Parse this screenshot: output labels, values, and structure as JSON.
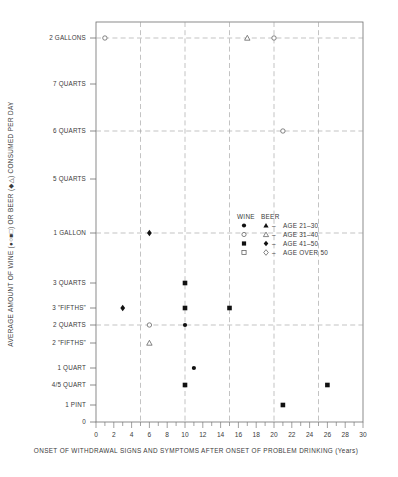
{
  "chart_data": {
    "type": "scatter",
    "title": "",
    "xlabel": "ONSET OF WITHDRAWAL SIGNS AND SYMPTOMS AFTER ONSET OF PROBLEM DRINKING (Years)",
    "ylabel": "AVERAGE AMOUNT OF WINE (●○■□) OR BEER (▲△) CONSUMED PER DAY",
    "xlim": [
      0,
      30
    ],
    "ylim": [
      0,
      12
    ],
    "grid": true,
    "legend_position": "inside-center-right",
    "x_ticks": [
      0,
      2,
      4,
      6,
      8,
      10,
      12,
      14,
      16,
      18,
      20,
      22,
      24,
      26,
      28,
      30
    ],
    "x_tick_labels": [
      "0",
      "2",
      "4",
      "6",
      "8",
      "10",
      "12",
      "14",
      "16",
      "18",
      "20",
      "22",
      "24",
      "26",
      "28",
      "30"
    ],
    "x_gridlines": [
      5,
      10,
      15,
      20,
      25
    ],
    "y_ticks": [
      12,
      11,
      10,
      9,
      8,
      7,
      6,
      5,
      4,
      3,
      2,
      1,
      0
    ],
    "y_tick_labels": [
      "2 GALLONS",
      "7 QUARTS",
      "6 QUARTS",
      "5 QUARTS",
      "1 GALLON",
      "3 QUARTS",
      "3 \"FIFTHS\"",
      "2 QUARTS",
      "2 \"FIFTHS\"",
      "1 QUART",
      "4/5 QUART",
      "1 PINT",
      "0"
    ],
    "y_gridlines": [
      "2 GALLONS",
      "6 QUARTS",
      "1 GALLON",
      "2 QUARTS"
    ],
    "series": [
      {
        "name": "WINE AGE 21-30",
        "beverage": "WINE",
        "age": "AGE 21-30",
        "marker": "filled-circle",
        "points": [
          {
            "x": 10,
            "y_label": "2 QUARTS"
          },
          {
            "x": 11,
            "y_label": "1 QUART"
          }
        ]
      },
      {
        "name": "BEER AGE 21-30",
        "beverage": "BEER",
        "age": "AGE 21-30",
        "marker": "filled-triangle",
        "points": []
      },
      {
        "name": "WINE AGE 31-40",
        "beverage": "WINE",
        "age": "AGE 31-40",
        "marker": "open-circle",
        "points": [
          {
            "x": 1,
            "y_label": "2 GALLONS"
          },
          {
            "x": 20,
            "y_label": "2 GALLONS"
          },
          {
            "x": 21,
            "y_label": "6 QUARTS"
          },
          {
            "x": 6,
            "y_label": "2 QUARTS"
          }
        ]
      },
      {
        "name": "BEER AGE 31-40",
        "beverage": "BEER",
        "age": "AGE 31-40",
        "marker": "open-triangle",
        "points": [
          {
            "x": 17,
            "y_label": "2 GALLONS"
          },
          {
            "x": 6,
            "y_label": "2 \"FIFTHS\""
          }
        ]
      },
      {
        "name": "WINE AGE 41-50",
        "beverage": "WINE",
        "age": "AGE 41-50",
        "marker": "filled-square",
        "points": [
          {
            "x": 10,
            "y_label": "3 QUARTS"
          },
          {
            "x": 10,
            "y_label": "3 \"FIFTHS\""
          },
          {
            "x": 15,
            "y_label": "3 \"FIFTHS\""
          },
          {
            "x": 10,
            "y_label": "4/5 QUART"
          },
          {
            "x": 21,
            "y_label": "1 PINT"
          },
          {
            "x": 26,
            "y_label": "4/5 QUART"
          }
        ]
      },
      {
        "name": "BEER AGE 41-50",
        "beverage": "BEER",
        "age": "AGE 41-50",
        "marker": "filled-diamond",
        "points": [
          {
            "x": 6,
            "y_label": "1 GALLON"
          },
          {
            "x": 3,
            "y_label": "3 \"FIFTHS\""
          }
        ]
      },
      {
        "name": "WINE AGE OVER 50",
        "beverage": "WINE",
        "age": "AGE OVER 50",
        "marker": "open-square",
        "points": []
      },
      {
        "name": "BEER AGE OVER 50",
        "beverage": "BEER",
        "age": "AGE OVER 50",
        "marker": "open-diamond",
        "points": []
      }
    ]
  },
  "axes": {
    "y_title": "AVERAGE  AMOUNT  OF  WINE (●○■□)  OR  BEER (◆△)  CONSUMED  PER  DAY",
    "x_title": "ONSET OF  WITHDRAWAL  SIGNS AND  SYMPTOMS  AFTER  ONSET OF  PROBLEM  DRINKING (Years)",
    "y_labels": {
      "l0": "2 GALLONS",
      "l1": "7 QUARTS",
      "l2": "6 QUARTS",
      "l3": "5 QUARTS",
      "l4": "1 GALLON",
      "l5": "3 QUARTS",
      "l6": "3 \"FIFTHS\"",
      "l7": "2 QUARTS",
      "l8": "2 \"FIFTHS\"",
      "l9": "1 QUART",
      "l10": "4/5 QUART",
      "l11": "1 PINT",
      "l12": "0"
    },
    "x_labels": {
      "t0": "0",
      "t1": "2",
      "t2": "4",
      "t3": "6",
      "t4": "8",
      "t5": "10",
      "t6": "12",
      "t7": "14",
      "t8": "16",
      "t9": "18",
      "t10": "20",
      "t11": "22",
      "t12": "24",
      "t13": "26",
      "t14": "28",
      "t15": "30"
    }
  },
  "legend": {
    "header_wine": "WINE",
    "header_beer": "BEER",
    "dash": "–",
    "rows": [
      {
        "age": "AGE  21–30"
      },
      {
        "age": "AGE  31–40"
      },
      {
        "age": "AGE  41–50"
      },
      {
        "age": "AGE OVER 50"
      }
    ]
  },
  "colors": {
    "marker_fill": "#111111",
    "marker_open_stroke": "#5c5c5c",
    "grid": "#9a9a9a",
    "axis": "#6e6e6e",
    "text": "#3a3a3a",
    "background": "#ffffff"
  }
}
